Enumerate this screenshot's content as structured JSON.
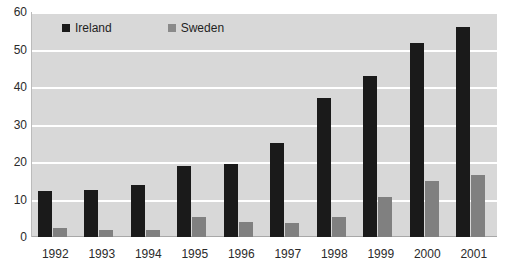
{
  "chart_data": {
    "type": "bar",
    "title": "",
    "subtitle": "",
    "xlabel": "",
    "ylabel": "",
    "categories": [
      "1992",
      "1993",
      "1994",
      "1995",
      "1996",
      "1997",
      "1998",
      "1999",
      "2000",
      "2001"
    ],
    "series": [
      {
        "name": "Ireland",
        "color": "#1a1a1a",
        "values": [
          12.3,
          12.5,
          14.0,
          19.0,
          19.5,
          25.0,
          37.0,
          43.0,
          51.8,
          56.0
        ]
      },
      {
        "name": "Sweden",
        "color": "#808080",
        "values": [
          2.3,
          1.8,
          1.9,
          5.3,
          4.0,
          3.8,
          5.3,
          10.8,
          15.0,
          16.5
        ]
      }
    ],
    "ylim": [
      0,
      60
    ],
    "yticks": [
      0,
      10,
      20,
      30,
      40,
      50,
      60
    ],
    "ytick_labels": [
      "0",
      "10",
      "20",
      "30",
      "40",
      "50",
      "60"
    ],
    "grid": true,
    "grid_color": "#ffffff",
    "legend_position": "top-left-inside",
    "plot_background": "#d8d8d8",
    "figure_background": "#ffffff"
  },
  "legend": {
    "items": [
      {
        "label": "Ireland",
        "swatch": "legend-swatch-ireland"
      },
      {
        "label": "Sweden",
        "swatch": "legend-swatch-sweden"
      }
    ]
  }
}
